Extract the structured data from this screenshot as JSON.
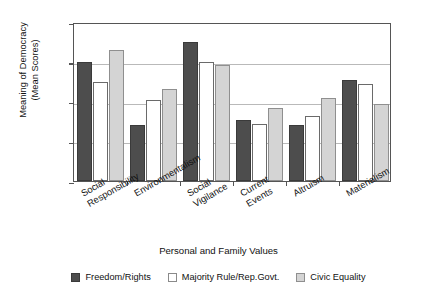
{
  "chart_data": {
    "type": "bar",
    "title": "",
    "xlabel": "Personal and Family Values",
    "ylabel": "Meaning of Democracy\n(Mean Scores)",
    "ylim": [
      2.5,
      4.5
    ],
    "ytick_values": [
      2.5,
      3,
      3.5,
      4,
      4.5
    ],
    "ytick_labels": [
      "2.5",
      "3",
      "3.5",
      "4",
      "4.5"
    ],
    "grid": true,
    "legend_position": "bottom",
    "categories": [
      "Social\nResponsibility",
      "Environmentalism",
      "Social\nVigilance",
      "Current\nEvents",
      "Altruism",
      "Materialism"
    ],
    "series": [
      {
        "name": "Freedom/Rights",
        "color": "#4d4d4d",
        "values": [
          4.0,
          3.2,
          4.25,
          3.27,
          3.21,
          3.77
        ]
      },
      {
        "name": "Majority Rule/Rep.Govt.",
        "color": "#ffffff",
        "values": [
          3.75,
          3.52,
          4.0,
          3.22,
          3.32,
          3.72
        ]
      },
      {
        "name": "Civic Equality",
        "color": "#d4d4d4",
        "values": [
          4.15,
          3.66,
          3.96,
          3.42,
          3.55,
          3.47
        ]
      }
    ]
  },
  "axes": {
    "y_title": "Meaning of Democracy\n(Mean Scores)",
    "x_title": "Personal and Family Values"
  },
  "legend": {
    "items": [
      {
        "label": "Freedom/Rights",
        "swatch": "dark-filled-swatch"
      },
      {
        "label": "Majority Rule/Rep.Govt.",
        "swatch": "white-outlined-swatch"
      },
      {
        "label": "Civic Equality",
        "swatch": "light-gray-swatch"
      }
    ]
  }
}
